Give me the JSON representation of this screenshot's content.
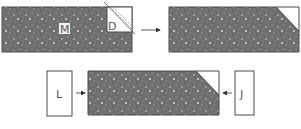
{
  "diagram": {
    "step1": {
      "main_block_label": "M",
      "corner_block_label": "D"
    },
    "step2": {
      "description": "block with corner removed"
    },
    "step3": {
      "left_block_label": "L",
      "right_block_label": "J"
    },
    "colors": {
      "texture_fill": "#6e6e6e",
      "outline": "#4a4a4a",
      "arrow": "#333333",
      "background": "#ffffff"
    }
  }
}
